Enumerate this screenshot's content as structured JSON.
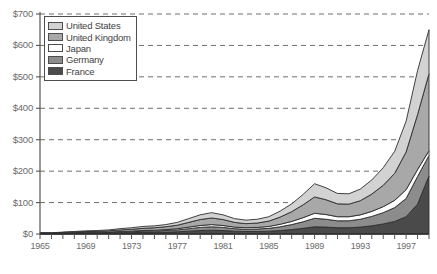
{
  "chart_data": {
    "type": "area",
    "stacked": true,
    "title": "",
    "xlabel": "",
    "ylabel": "",
    "xlim": [
      1965,
      1999
    ],
    "ylim": [
      0,
      700
    ],
    "y_tick_values": [
      0,
      100,
      200,
      300,
      400,
      500,
      600,
      700
    ],
    "y_tick_labels": [
      "$0",
      "$100",
      "$200",
      "$300",
      "$400",
      "$500",
      "$600",
      "$700"
    ],
    "x_tick_labels": [
      "1965",
      "1969",
      "1973",
      "1977",
      "1981",
      "1985",
      "1989",
      "1993",
      "1997"
    ],
    "x_tick_values": [
      1965,
      1969,
      1973,
      1977,
      1981,
      1985,
      1989,
      1993,
      1997
    ],
    "x_minor_tick_step": 1,
    "grid": "horizontal-dashed",
    "legend_position": "top-left",
    "x": [
      1965,
      1966,
      1967,
      1968,
      1969,
      1970,
      1971,
      1972,
      1973,
      1974,
      1975,
      1976,
      1977,
      1978,
      1979,
      1980,
      1981,
      1982,
      1983,
      1984,
      1985,
      1986,
      1987,
      1988,
      1989,
      1990,
      1991,
      1992,
      1993,
      1994,
      1995,
      1996,
      1997,
      1998,
      1999
    ],
    "series": [
      {
        "name": "France",
        "color": "#4a4a4a",
        "values": [
          1,
          1,
          1,
          2,
          2,
          2,
          3,
          3,
          4,
          5,
          5,
          6,
          7,
          9,
          11,
          12,
          11,
          9,
          8,
          8,
          9,
          11,
          14,
          18,
          23,
          22,
          20,
          20,
          22,
          26,
          32,
          40,
          55,
          95,
          185
        ]
      },
      {
        "name": "Germany",
        "color": "#8c8c8c",
        "values": [
          1,
          1,
          1,
          1,
          2,
          2,
          2,
          3,
          3,
          4,
          4,
          5,
          6,
          8,
          10,
          11,
          10,
          8,
          7,
          8,
          9,
          12,
          16,
          21,
          27,
          25,
          22,
          22,
          25,
          30,
          36,
          44,
          58,
          88,
          65
        ]
      },
      {
        "name": "Japan",
        "color": "#ffffff",
        "values": [
          0,
          0,
          1,
          1,
          1,
          1,
          1,
          2,
          2,
          2,
          3,
          3,
          4,
          5,
          6,
          7,
          6,
          5,
          5,
          5,
          6,
          8,
          10,
          13,
          16,
          15,
          13,
          13,
          14,
          16,
          19,
          23,
          28,
          22,
          15
        ]
      },
      {
        "name": "United Kingdom",
        "color": "#a8a8a8",
        "values": [
          1,
          1,
          2,
          2,
          3,
          3,
          4,
          5,
          6,
          7,
          8,
          9,
          11,
          15,
          19,
          21,
          19,
          15,
          13,
          14,
          17,
          23,
          31,
          41,
          52,
          47,
          41,
          40,
          45,
          55,
          68,
          86,
          120,
          175,
          245
        ]
      },
      {
        "name": "United States",
        "color": "#d2d2d2",
        "values": [
          1,
          1,
          1,
          2,
          2,
          3,
          3,
          4,
          5,
          6,
          6,
          7,
          9,
          12,
          15,
          17,
          15,
          12,
          11,
          12,
          14,
          19,
          25,
          33,
          42,
          38,
          33,
          33,
          37,
          45,
          56,
          70,
          98,
          140,
          140
        ]
      }
    ],
    "totals": [
      4,
      4,
      6,
      8,
      10,
      11,
      13,
      17,
      20,
      24,
      26,
      30,
      37,
      49,
      61,
      68,
      61,
      49,
      44,
      47,
      55,
      73,
      96,
      126,
      160,
      147,
      129,
      128,
      143,
      172,
      211,
      263,
      359,
      520,
      650
    ],
    "peak_annotation_year": 1999,
    "peak_annotation_value": 650
  },
  "legend": {
    "items": [
      {
        "label": "United States",
        "color": "#d2d2d2"
      },
      {
        "label": "United Kingdom",
        "color": "#a8a8a8"
      },
      {
        "label": "Japan",
        "color": "#ffffff"
      },
      {
        "label": "Germany",
        "color": "#8c8c8c"
      },
      {
        "label": "France",
        "color": "#4a4a4a"
      }
    ]
  },
  "caption": ""
}
